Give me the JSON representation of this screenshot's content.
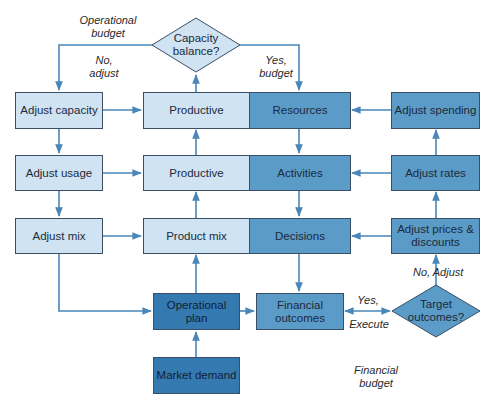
{
  "diagram": {
    "nodes": {
      "capacity_balance": "Capacity balance?",
      "adjust_capacity": "Adjust capacity",
      "productive_top": "Productive",
      "resources": "Resources",
      "adjust_spending": "Adjust spending",
      "adjust_usage": "Adjust usage",
      "productive_mid": "Productive",
      "activities": "Activities",
      "adjust_rates": "Adjust rates",
      "adjust_mix": "Adjust mix",
      "product_mix": "Product mix",
      "decisions": "Decisions",
      "adjust_prices": "Adjust prices & discounts",
      "operational_plan": "Operational plan",
      "financial_outcomes": "Financial outcomes",
      "target_outcomes": "Target outcomes?",
      "market_demand": "Market demand"
    },
    "edge_labels": {
      "operational_budget": "Operational budget",
      "no_adjust_left": "No, adjust",
      "yes_budget": "Yes, budget",
      "no_adjust_right": "No, Adjust",
      "yes": "Yes,",
      "execute": "Execute",
      "financial_budget": "Financial budget"
    },
    "colors": {
      "light_box": "#cfe3f3",
      "mid_box": "#5b9bc8",
      "dark_box": "#3579b1",
      "arrow": "#4a86b8"
    }
  }
}
